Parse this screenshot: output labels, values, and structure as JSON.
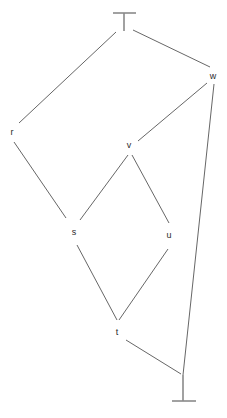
{
  "diagram": {
    "kind": "hasse-diagram",
    "title": "",
    "background_color": "#ffffff",
    "edge_color": "#555555",
    "tack_color": "#8a8a8a",
    "label_color": "#2b2b2b",
    "width": 227,
    "height": 418,
    "nodes": [
      {
        "id": "top",
        "label": "⊤",
        "glyph": "top-tack",
        "x": 124,
        "y": 20,
        "is_tack": true,
        "label_x": 124,
        "label_y": 21
      },
      {
        "id": "w",
        "label": "w",
        "glyph": "text-label",
        "x": 213,
        "y": 76,
        "is_tack": false,
        "label_x": 213,
        "label_y": 76
      },
      {
        "id": "r",
        "label": "r",
        "glyph": "text-label",
        "x": 12,
        "y": 132,
        "is_tack": false,
        "label_x": 12,
        "label_y": 132
      },
      {
        "id": "v",
        "label": "v",
        "glyph": "text-label",
        "x": 129,
        "y": 145,
        "is_tack": false,
        "label_x": 129,
        "label_y": 145
      },
      {
        "id": "s",
        "label": "s",
        "glyph": "text-label",
        "x": 74,
        "y": 232,
        "is_tack": false,
        "label_x": 74,
        "label_y": 232
      },
      {
        "id": "u",
        "label": "u",
        "glyph": "text-label",
        "x": 169,
        "y": 235,
        "is_tack": false,
        "label_x": 169,
        "label_y": 235
      },
      {
        "id": "t",
        "label": "t",
        "glyph": "text-label",
        "x": 117,
        "y": 332,
        "is_tack": false,
        "label_x": 117,
        "label_y": 332
      },
      {
        "id": "bottom",
        "label": "⊥",
        "glyph": "bottom-tack",
        "x": 183,
        "y": 392,
        "is_tack": true,
        "label_x": 183,
        "label_y": 391
      }
    ],
    "edges": [
      {
        "id": "top-r",
        "from": "top",
        "to": "r",
        "x1": 116,
        "y1": 32,
        "x2": 19,
        "y2": 123
      },
      {
        "id": "top-w",
        "from": "top",
        "to": "w",
        "x1": 133,
        "y1": 30,
        "x2": 210,
        "y2": 67
      },
      {
        "id": "w-v",
        "from": "w",
        "to": "v",
        "x1": 207,
        "y1": 83,
        "x2": 138,
        "y2": 141
      },
      {
        "id": "w-bot",
        "from": "w",
        "to": "bottom",
        "x1": 214,
        "y1": 84,
        "x2": 183,
        "y2": 375
      },
      {
        "id": "r-s",
        "from": "r",
        "to": "s",
        "x1": 14,
        "y1": 142,
        "x2": 66,
        "y2": 218
      },
      {
        "id": "v-s",
        "from": "v",
        "to": "s",
        "x1": 128,
        "y1": 155,
        "x2": 80,
        "y2": 220
      },
      {
        "id": "v-u",
        "from": "v",
        "to": "u",
        "x1": 132,
        "y1": 155,
        "x2": 169,
        "y2": 223
      },
      {
        "id": "s-t",
        "from": "s",
        "to": "t",
        "x1": 77,
        "y1": 245,
        "x2": 117,
        "y2": 320
      },
      {
        "id": "u-t",
        "from": "u",
        "to": "t",
        "x1": 168,
        "y1": 249,
        "x2": 119,
        "y2": 320
      },
      {
        "id": "t-bot",
        "from": "t",
        "to": "bottom",
        "x1": 126,
        "y1": 340,
        "x2": 181,
        "y2": 374
      }
    ],
    "tacks": [
      {
        "id": "top-tack",
        "for_node": "top",
        "bar_x1": 113,
        "bar_x2": 136,
        "bar_y": 13,
        "stem_x": 124,
        "stem_y1": 13,
        "stem_y2": 31
      },
      {
        "id": "bottom-tack",
        "for_node": "bottom",
        "bar_x1": 172,
        "bar_x2": 196,
        "bar_y": 401,
        "stem_x": 183,
        "stem_y1": 375,
        "stem_y2": 401
      }
    ]
  }
}
